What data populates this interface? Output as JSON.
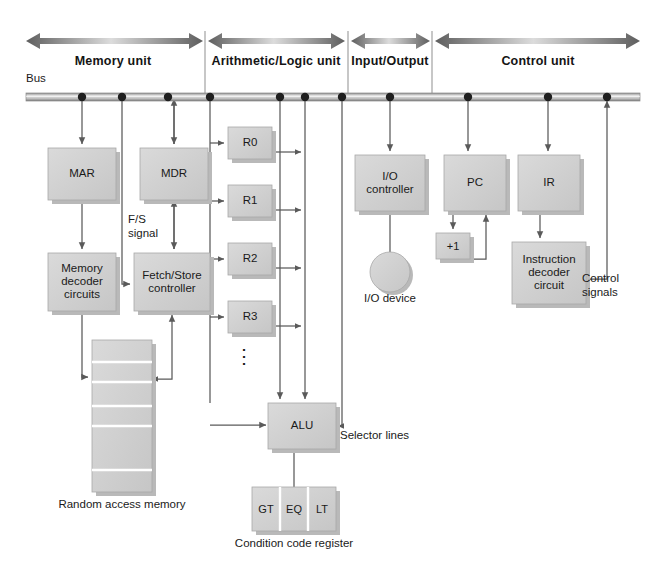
{
  "diagram": {
    "bus_label": "Bus",
    "colors": {
      "box_fill": "#d3d3d3",
      "box_fill_light": "#cfcfcf",
      "box_stroke": "#9a9a9a",
      "shadow": "#b9b9b9",
      "line": "#4d4d4d",
      "text": "#1a1a1a",
      "arrow_dark": "#5a5a5a",
      "arrow_light": "#d8d8d8",
      "bus_fill": "#c9c9c9",
      "divider": "#8f8f8f"
    },
    "units": [
      {
        "label": "Memory unit",
        "center_x": 113,
        "left": 26,
        "right": 203
      },
      {
        "label": "Arithmetic/Logic unit",
        "center_x": 276,
        "left": 208,
        "right": 345
      },
      {
        "label": "Input/Output",
        "center_x": 390,
        "left": 351,
        "right": 430
      },
      {
        "label": "Control unit",
        "center_x": 538,
        "left": 435,
        "right": 640
      }
    ],
    "dividers_x": [
      205,
      348,
      432
    ],
    "bus": {
      "y": 97,
      "x_start": 26,
      "x_end": 640,
      "dots_x": [
        82,
        122,
        168,
        210,
        280,
        305,
        342,
        390,
        468,
        548,
        607
      ]
    },
    "boxes": [
      {
        "name": "mar",
        "label": "MAR",
        "x": 48,
        "y": 148,
        "w": 68,
        "h": 52
      },
      {
        "name": "mdr",
        "label": "MDR",
        "x": 140,
        "y": 148,
        "w": 68,
        "h": 52
      },
      {
        "name": "memory-decoder",
        "label": "Memory\ndecoder\ncircuits",
        "x": 48,
        "y": 253,
        "w": 68,
        "h": 58
      },
      {
        "name": "fetch-store",
        "label": "Fetch/Store\ncontroller",
        "x": 134,
        "y": 253,
        "w": 76,
        "h": 58
      },
      {
        "name": "register-r0",
        "label": "R0",
        "x": 228,
        "y": 127,
        "w": 44,
        "h": 32
      },
      {
        "name": "register-r1",
        "label": "R1",
        "x": 228,
        "y": 185,
        "w": 44,
        "h": 32
      },
      {
        "name": "register-r2",
        "label": "R2",
        "x": 228,
        "y": 243,
        "w": 44,
        "h": 32
      },
      {
        "name": "register-r3",
        "label": "R3",
        "x": 228,
        "y": 301,
        "w": 44,
        "h": 32
      },
      {
        "name": "alu",
        "label": "ALU",
        "x": 268,
        "y": 403,
        "w": 68,
        "h": 46
      },
      {
        "name": "io-controller",
        "label": "I/O\ncontroller",
        "x": 355,
        "y": 155,
        "w": 70,
        "h": 56
      },
      {
        "name": "pc",
        "label": "PC",
        "x": 444,
        "y": 155,
        "w": 62,
        "h": 56
      },
      {
        "name": "plus-one",
        "label": "+1",
        "x": 436,
        "y": 233,
        "w": 34,
        "h": 26
      },
      {
        "name": "ir",
        "label": "IR",
        "x": 518,
        "y": 155,
        "w": 62,
        "h": 56
      },
      {
        "name": "instruction-decoder",
        "label": "Instruction\ndecoder\ncircuit",
        "x": 512,
        "y": 242,
        "w": 74,
        "h": 62
      }
    ],
    "condition_code": {
      "x": 252,
      "y": 487,
      "w": 84,
      "h": 44,
      "cells": [
        "GT",
        "EQ",
        "LT"
      ],
      "caption": "Condition code register"
    },
    "ram": {
      "x": 92,
      "y": 340,
      "w": 60,
      "h": 152,
      "caption": "Random access memory",
      "caption_x": 122,
      "caption_y": 500,
      "row_dividers_y": [
        362,
        382,
        406,
        426,
        470
      ]
    },
    "io_device": {
      "cx": 390,
      "cy": 272,
      "r": 20,
      "label": "I/O device",
      "label_x": 390,
      "label_y": 296
    },
    "annotations": [
      {
        "name": "fs-signal-label",
        "text": "F/S\nsignal",
        "x": 128,
        "y": 213,
        "align": "left"
      },
      {
        "name": "selector-lines-label",
        "text": "Selector lines",
        "x": 340,
        "y": 429,
        "align": "left"
      },
      {
        "name": "control-signals-label",
        "text": "Control\nsignals",
        "x": 582,
        "y": 272,
        "align": "left"
      },
      {
        "name": "registers-ellipsis",
        "text": "⋮",
        "x": 244,
        "y": 346,
        "align": "center"
      }
    ],
    "register_names": [
      "R0",
      "R1",
      "R2",
      "R3"
    ]
  }
}
